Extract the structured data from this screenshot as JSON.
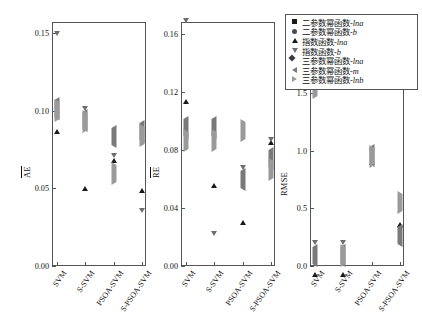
{
  "chart_data": {
    "type": "scatter",
    "title": "",
    "xlabel": "",
    "panels": [
      {
        "id": "panel-ae",
        "ylabel": "AE",
        "ylim": [
          0.0,
          0.157
        ],
        "yticks": [
          0.0,
          0.05,
          0.1,
          0.15
        ],
        "ytick_labels": [
          "0.00",
          "0.05",
          "0.10",
          "0.15"
        ],
        "categories": [
          "SVM",
          "S-SVM",
          "PSOA-SVM",
          "S-PSOA-SVM"
        ],
        "series": [
          {
            "name": "二参数幂函数-lna",
            "marker": "square",
            "color": "#1a1a1a",
            "values": [
              0.1045,
              0.0965,
              0.082,
              0.0445
            ]
          },
          {
            "name": "二参数幂函数-b",
            "marker": "circle",
            "color": "#4a4a4a",
            "values": [
              0.131,
              0.106,
              0.12,
              0.0175
            ]
          },
          {
            "name": "指数函数-lna",
            "marker": "up",
            "color": "#1a1a1a",
            "values": [
              0.093,
              0.0565,
              0.0745,
              0.0555
            ]
          },
          {
            "name": "指数函数-b",
            "marker": "down",
            "color": "#6e6e6e",
            "values": [
              0.142,
              0.094,
              0.064,
              0.0285
            ]
          },
          {
            "name": "三参数幂函数-lna",
            "marker": "diamond",
            "color": "#3a3a3a",
            "values": [
              0.1035,
              0.0955,
              0.0825,
              0.0855
            ]
          },
          {
            "name": "三参数幂函数-m",
            "marker": "left",
            "color": "#7a7a7a",
            "values": [
              0.101,
              0.093,
              0.083,
              0.086
            ]
          },
          {
            "name": "三参数幂函数-lnb",
            "marker": "right",
            "color": "#9a9a9a",
            "values": [
              0.0995,
              0.0925,
              0.059,
              0.0835
            ]
          }
        ]
      },
      {
        "id": "panel-re",
        "ylabel": "RE",
        "ylim": [
          0.0,
          0.168
        ],
        "yticks": [
          0.0,
          0.04,
          0.08,
          0.12,
          0.16
        ],
        "ytick_labels": [
          "0.00",
          "0.04",
          "0.08",
          "0.12",
          "0.16"
        ],
        "categories": [
          "SVM",
          "S-SVM",
          "PSOA-SVM",
          "S-PSOA-SVM"
        ],
        "series": [
          {
            "name": "二参数幂函数-lna",
            "marker": "square",
            "color": "#1a1a1a",
            "values": [
              0.1305,
              0.0435,
              0.0615,
              0.051
            ]
          },
          {
            "name": "二参数幂函数-b",
            "marker": "circle",
            "color": "#4a4a4a",
            "values": [
              0.151,
              0.005,
              0.062,
              0.0855
            ]
          },
          {
            "name": "指数函数-lna",
            "marker": "up",
            "color": "#1a1a1a",
            "values": [
              0.1205,
              0.0625,
              0.037,
              0.0925
            ]
          },
          {
            "name": "指数函数-b",
            "marker": "down",
            "color": "#6e6e6e",
            "values": [
              0.161,
              0.0145,
              0.06,
              0.079
            ]
          },
          {
            "name": "三参数幂函数-lna",
            "marker": "diamond",
            "color": "#3a3a3a",
            "values": [
              0.061,
              0.061,
              0.0615,
              0.0865
            ]
          },
          {
            "name": "三参数幂函数-m",
            "marker": "left",
            "color": "#7a7a7a",
            "values": [
              0.095,
              0.095,
              0.059,
              0.074
            ]
          },
          {
            "name": "三参数幂函数-lnb",
            "marker": "right",
            "color": "#9a9a9a",
            "values": [
              0.086,
              0.086,
              0.093,
              0.066
            ]
          }
        ]
      },
      {
        "id": "panel-rmse",
        "ylabel": "RMSE",
        "ylim": [
          0.0,
          2.12
        ],
        "yticks": [
          0.0,
          0.5,
          1.0,
          1.5,
          2.0
        ],
        "ytick_labels": [
          "0.0",
          "0.5",
          "1.0",
          "1.5",
          "2.0"
        ],
        "categories": [
          "SVM",
          "S-SVM",
          "PSOA-SVM",
          "S-PSOA-SVM"
        ],
        "series": [
          {
            "name": "二参数幂函数-lna",
            "marker": "square",
            "color": "#1a1a1a",
            "values": [
              1.75,
              0.25,
              1.05,
              0.83
            ]
          },
          {
            "name": "二参数幂函数-b",
            "marker": "circle",
            "color": "#4a4a4a",
            "values": [
              0.05,
              0.05,
              0.97,
              1.0
            ]
          },
          {
            "name": "指数函数-lna",
            "marker": "up",
            "color": "#1a1a1a",
            "values": [
              0.02,
              0.02,
              0.99,
              0.45
            ]
          },
          {
            "name": "指数函数-b",
            "marker": "down",
            "color": "#6e6e6e",
            "values": [
              0.1,
              0.1,
              0.9,
              0.22
            ]
          },
          {
            "name": "三参数幂函数-lna",
            "marker": "diamond",
            "color": "#3a3a3a",
            "values": [
              0.12,
              0.38,
              1.07,
              1.27
            ]
          },
          {
            "name": "三参数幂函数-m",
            "marker": "left",
            "color": "#7a7a7a",
            "values": [
              0.09,
              0.09,
              0.96,
              0.26
            ]
          },
          {
            "name": "三参数幂函数-lnb",
            "marker": "right",
            "color": "#9a9a9a",
            "values": [
              1.55,
              0.09,
              0.95,
              0.55
            ]
          }
        ]
      }
    ],
    "legend": {
      "position": "top-right",
      "entries": [
        {
          "label": "二参数幂函数-lna",
          "marker": "square",
          "color": "#1a1a1a"
        },
        {
          "label": "二参数幂函数-b",
          "marker": "circle",
          "color": "#4a4a4a"
        },
        {
          "label": "指数函数-lna",
          "marker": "up",
          "color": "#1a1a1a"
        },
        {
          "label": "指数函数-b",
          "marker": "down",
          "color": "#6e6e6e"
        },
        {
          "label": "三参数幂函数-lna",
          "marker": "diamond",
          "color": "#3a3a3a"
        },
        {
          "label": "三参数幂函数-m",
          "marker": "left",
          "color": "#7a7a7a"
        },
        {
          "label": "三参数幂函数-lnb",
          "marker": "right",
          "color": "#9a9a9a"
        }
      ]
    }
  }
}
